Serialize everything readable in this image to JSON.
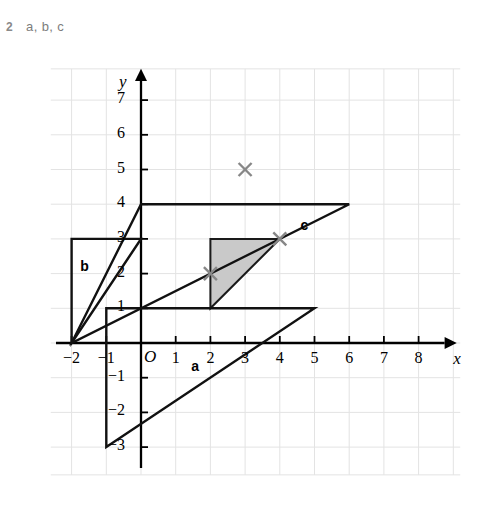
{
  "question": {
    "number": "2",
    "text": "a, b, c"
  },
  "chart_data": {
    "type": "diagram",
    "title": "",
    "xlabel": "x",
    "ylabel": "y",
    "xlim": [
      -2.6,
      9.2
    ],
    "ylim": [
      -3.8,
      7.9
    ],
    "grid": true,
    "grid_step": 1,
    "x_ticks": [
      -2,
      -1,
      1,
      2,
      3,
      4,
      5,
      6,
      7,
      8
    ],
    "x_tick_labels": [
      "-2",
      "-1",
      "1",
      "2",
      "3",
      "4",
      "5",
      "6",
      "7",
      "8"
    ],
    "y_ticks": [
      -3,
      -2,
      -1,
      1,
      2,
      3,
      4,
      5,
      6,
      7
    ],
    "y_tick_labels": [
      "-3",
      "-2",
      "-1",
      "1",
      "2",
      "3",
      "4",
      "5",
      "6",
      "7"
    ],
    "origin_label": "O",
    "shapes": [
      {
        "name": "shaded-triangle",
        "label": "",
        "points": [
          [
            2,
            1
          ],
          [
            2,
            3
          ],
          [
            4,
            3
          ]
        ],
        "fill": "#c9c9c9",
        "stroke": "#1a1a1a",
        "stroke_width": 2
      },
      {
        "name": "triangle-a",
        "label": "a",
        "label_at": [
          1.45,
          -0.42
        ],
        "points": [
          [
            -1,
            -3
          ],
          [
            -1,
            1
          ],
          [
            5,
            1
          ]
        ],
        "fill": "none",
        "stroke": "#111111",
        "stroke_width": 2.4
      },
      {
        "name": "triangle-bc",
        "label": "b",
        "label_at": [
          -1.75,
          2.45
        ],
        "points": [
          [
            -2,
            0
          ],
          [
            -2,
            3
          ],
          [
            0,
            3
          ]
        ],
        "fill": "none",
        "stroke": "#111111",
        "stroke_width": 2.4
      },
      {
        "name": "triangle-c",
        "label": "c",
        "label_at": [
          4.6,
          3.62
        ],
        "points": [
          [
            -2,
            0
          ],
          [
            0,
            4
          ],
          [
            6,
            4
          ]
        ],
        "fill": "none",
        "stroke": "#111111",
        "stroke_width": 2.4
      }
    ],
    "markers": [
      {
        "name": "cross-marker",
        "x": 3,
        "y": 5,
        "symbol": "x",
        "color": "#878787"
      },
      {
        "name": "cross-marker",
        "x": 2,
        "y": 2,
        "symbol": "x",
        "color": "#878787"
      },
      {
        "name": "cross-marker",
        "x": 4,
        "y": 3,
        "symbol": "x",
        "color": "#878787"
      }
    ],
    "colors": {
      "grid": "#e3e3e3",
      "axis": "#000000",
      "shape_stroke": "#111111",
      "shaded_fill": "#c9c9c9",
      "marker": "#878787",
      "question_text": "#7d7d7d"
    }
  }
}
